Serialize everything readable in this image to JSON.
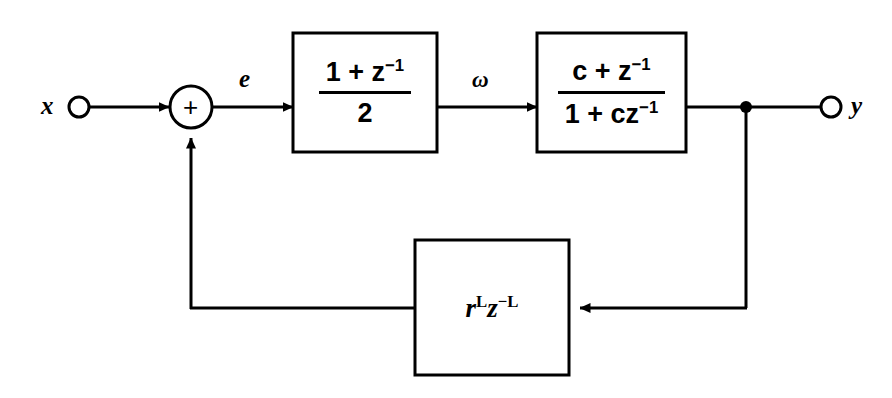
{
  "diagram": {
    "background_color": "#ffffff",
    "line_color": "#000000",
    "input": {
      "label": "x",
      "node_type": "open-circle"
    },
    "output": {
      "label": "y",
      "node_type": "open-circle"
    },
    "summer": {
      "operator": "+",
      "shape": "circle"
    },
    "signals": {
      "error": "e",
      "omega": "ω"
    },
    "blocks": [
      {
        "id": "lowpass",
        "name": "averaging-lowpass-block",
        "numerator_prefix": "1 + z",
        "numerator_exponent": "−1",
        "denominator": "2",
        "form": "fraction"
      },
      {
        "id": "allpass",
        "name": "allpass-tuning-block",
        "numerator_prefix": "c + z",
        "numerator_exponent": "−1",
        "denominator_prefix": "1 + cz",
        "denominator_exponent": "−1",
        "form": "fraction"
      },
      {
        "id": "delay",
        "name": "delay-loop-block",
        "base_r": "r",
        "exp_r": "L",
        "base_z": "z",
        "exp_z": "−L",
        "form": "monomial"
      }
    ]
  }
}
